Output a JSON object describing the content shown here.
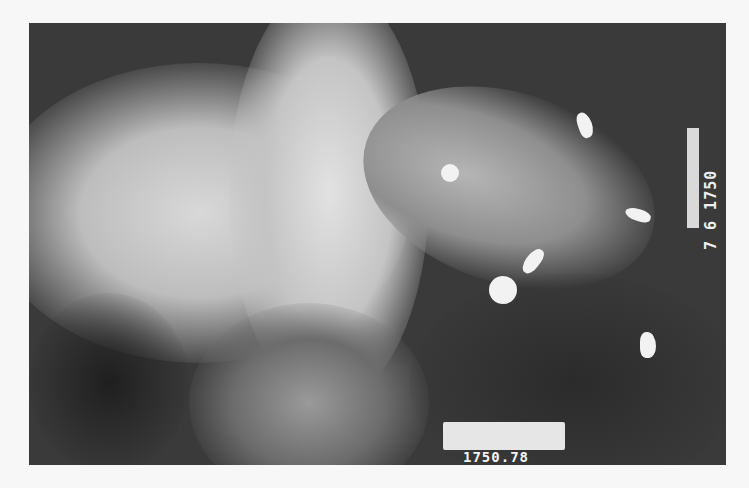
{
  "image": {
    "description": "Grayscale chest radiograph with radiopaque markers",
    "background_color": "#f7f7f7",
    "film_color": "#3a3a3a"
  },
  "annotations": {
    "bottom_label": "1750.78",
    "right_label": "7 6 1750"
  },
  "markers": [
    {
      "shape": "crescent",
      "x": 586,
      "y": 125
    },
    {
      "shape": "round",
      "x": 451,
      "y": 173
    },
    {
      "shape": "crescent",
      "x": 637,
      "y": 216
    },
    {
      "shape": "crescent",
      "x": 536,
      "y": 258
    },
    {
      "shape": "round",
      "x": 502,
      "y": 289
    },
    {
      "shape": "crescent",
      "x": 648,
      "y": 345
    }
  ]
}
